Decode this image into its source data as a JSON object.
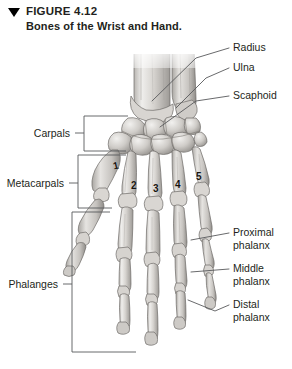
{
  "figure": {
    "marker_icon": "triangle-down-icon",
    "number_label": "FIGURE 4.12",
    "caption": "Bones of the Wrist and Hand.",
    "illustration_alt": "anterior view of skeletal wrist and hand"
  },
  "colors": {
    "background": "#ffffff",
    "text": "#231f20",
    "leader_line": "#58595b",
    "bone_light": "#efedea",
    "bone_mid": "#c9c6c2",
    "bone_dark": "#8d8a86",
    "bone_outline": "#6f6c68",
    "marker": "#000000"
  },
  "labels": {
    "right": [
      {
        "id": "radius",
        "text": "Radius",
        "line2": ""
      },
      {
        "id": "ulna",
        "text": "Ulna",
        "line2": ""
      },
      {
        "id": "scaphoid",
        "text": "Scaphoid",
        "line2": ""
      },
      {
        "id": "proximal",
        "text": "Proximal",
        "line2": "phalanx"
      },
      {
        "id": "middle",
        "text": "Middle",
        "line2": "phalanx"
      },
      {
        "id": "distal",
        "text": "Distal",
        "line2": "phalanx"
      }
    ],
    "left": [
      {
        "id": "carpals",
        "text": "Carpals"
      },
      {
        "id": "metacarpals",
        "text": "Metacarpals"
      },
      {
        "id": "phalanges",
        "text": "Phalanges"
      }
    ],
    "metacarpal_numbers": [
      "1",
      "2",
      "3",
      "4",
      "5"
    ]
  }
}
